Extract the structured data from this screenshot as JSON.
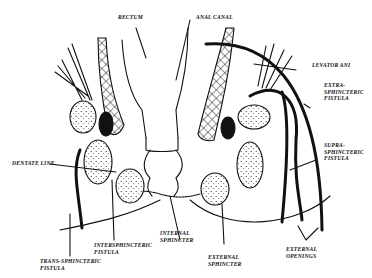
{
  "diagram": {
    "type": "anatomical line drawing",
    "labels": {
      "rectum": "RECTUM",
      "anal_canal": "ANAL CANAL",
      "levator_ani": "LEVATOR ANI",
      "extra_sphincteric": "EXTRA-\nSPHINCTERIC\nFISTULA",
      "supra_sphincteric": "SUPRA-\nSPHINCTERIC\nFISTULA",
      "dentate_line": "DENTATE LINE",
      "internal_sphincter": "INTERNAL\nSPHINCTER",
      "intersphincteric": "INTERSPHINCTERIC\nFISTULA",
      "trans_sphincteric": "TRANS-SPHINCTERIC\nFISTULA",
      "external_sphincter": "EXTERNAL\nSPHINCTER",
      "external_openings": "EXTERNAL\nOPENINGS"
    },
    "colors": {
      "ink": "#111111",
      "background": "#ffffff"
    }
  }
}
